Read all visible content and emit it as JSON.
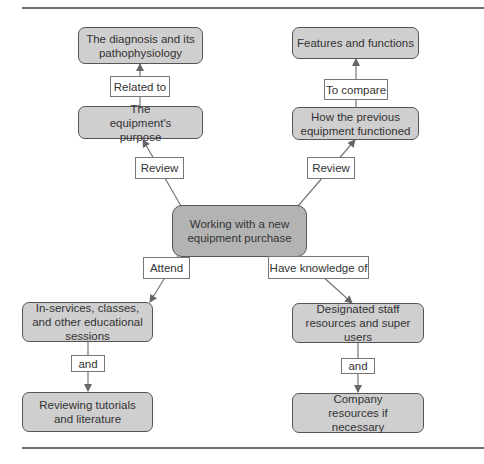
{
  "diagram": {
    "title": "Working with a new equipment purchase",
    "colors": {
      "node_fill": "#cfcfcf",
      "center_fill": "#b3b3b3",
      "border": "#555555",
      "edge": "#666666",
      "label_fill": "#ffffff"
    },
    "nodes": {
      "center": "Working with a new equipment purchase",
      "diagnosis": "The diagnosis and its pathophysiology",
      "equipment_purpose": "The equipment's purpose",
      "features": "Features and functions",
      "previous_equipment": "How the previous equipment functioned",
      "inservices": "In-services, classes, and other educational sessions",
      "reviewing": "Reviewing tutorials and literature",
      "designated_staff": "Designated staff resources and super users",
      "company": "Company resources if necessary"
    },
    "edge_labels": {
      "related_to": "Related to",
      "to_compare": "To compare",
      "review_left": "Review",
      "review_right": "Review",
      "attend": "Attend",
      "have_knowledge": "Have knowledge of",
      "and_left": "and",
      "and_right": "and"
    },
    "edges": [
      {
        "from": "equipment_purpose",
        "to": "diagnosis",
        "label": "Related to"
      },
      {
        "from": "previous_equipment",
        "to": "features",
        "label": "To compare"
      },
      {
        "from": "center",
        "to": "equipment_purpose",
        "label": "Review"
      },
      {
        "from": "center",
        "to": "previous_equipment",
        "label": "Review"
      },
      {
        "from": "center",
        "to": "inservices",
        "label": "Attend"
      },
      {
        "from": "center",
        "to": "designated_staff",
        "label": "Have knowledge of"
      },
      {
        "from": "inservices",
        "to": "reviewing",
        "label": "and"
      },
      {
        "from": "designated_staff",
        "to": "company",
        "label": "and"
      }
    ]
  }
}
